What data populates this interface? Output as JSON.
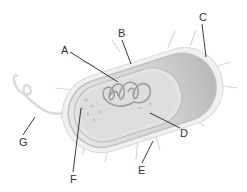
{
  "diagram": {
    "labels": [
      {
        "id": "A",
        "text": "A",
        "x": 61,
        "y": 45
      },
      {
        "id": "B",
        "text": "B",
        "x": 118,
        "y": 28
      },
      {
        "id": "C",
        "text": "C",
        "x": 199,
        "y": 12
      },
      {
        "id": "D",
        "text": "D",
        "x": 180,
        "y": 128
      },
      {
        "id": "E",
        "text": "E",
        "x": 138,
        "y": 165
      },
      {
        "id": "F",
        "text": "F",
        "x": 70,
        "y": 174
      },
      {
        "id": "G",
        "text": "G",
        "x": 19,
        "y": 137
      }
    ]
  },
  "colors": {
    "background": "#ffffff",
    "capsule": "#e8e8e8",
    "cell_wall": "#c9c9c9",
    "cytoplasm": "#dcdcdc",
    "nucleoid": "#a8a8a8",
    "leader_line": "#222222",
    "label_text": "#333333"
  }
}
